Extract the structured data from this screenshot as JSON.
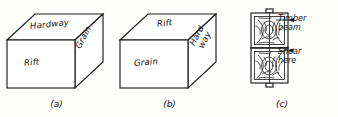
{
  "figure": {
    "type": "technical-illustration",
    "panels": [
      {
        "id": "a",
        "caption": "(a)",
        "shape": "isometric-block",
        "face_labels": {
          "top": "Hardway",
          "front": "Rift",
          "right": "Grain"
        }
      },
      {
        "id": "b",
        "caption": "(b)",
        "shape": "isometric-block",
        "face_labels": {
          "top": "Rift",
          "front": "Grain",
          "right_line1": "Hard",
          "right_line2": "way"
        }
      },
      {
        "id": "c",
        "caption": "(c)",
        "shape": "beam-cross-section",
        "annotations": [
          {
            "id": "timber-beam",
            "line1": "Timber",
            "line2": "beam"
          },
          {
            "id": "shear-here",
            "line1": "Shear",
            "line2": "here"
          }
        ]
      }
    ]
  },
  "colors": {
    "ink": "#1a1a1a",
    "paper": "#fdfdfc"
  }
}
